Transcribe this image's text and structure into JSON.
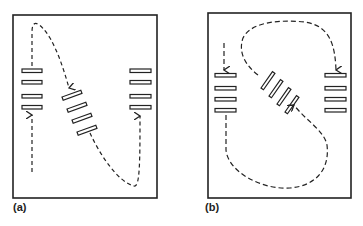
{
  "figure": {
    "panels": [
      {
        "label": "(a)",
        "description": "Two horizontal bar stacks at left and right with a tilted stack in between; dashed path from left stack up over and down into tilted stack, then continuing down and back up into right stack.",
        "elements": {
          "left_stack": "4 horizontal bars",
          "middle_stack": "4 bars tilted slightly",
          "right_stack": "4 horizontal bars",
          "arrows": [
            "upward arrow into left stack",
            "arrow into middle stack from top-left arc",
            "upward arrow into right stack"
          ]
        }
      },
      {
        "label": "(b)",
        "description": "Two horizontal bar stacks at left and right with a steeply tilted stack in the center; dashed S-shaped loop connecting them.",
        "elements": {
          "left_stack": "4 horizontal bars",
          "middle_stack": "4 bars tilted steeply",
          "right_stack": "4 horizontal bars",
          "arrows": [
            "downward arrow into left stack",
            "downward arrow into right stack",
            "arrow into middle stack from lower right"
          ]
        }
      }
    ],
    "colors": {
      "line": "#222222",
      "background": "#ffffff"
    }
  }
}
